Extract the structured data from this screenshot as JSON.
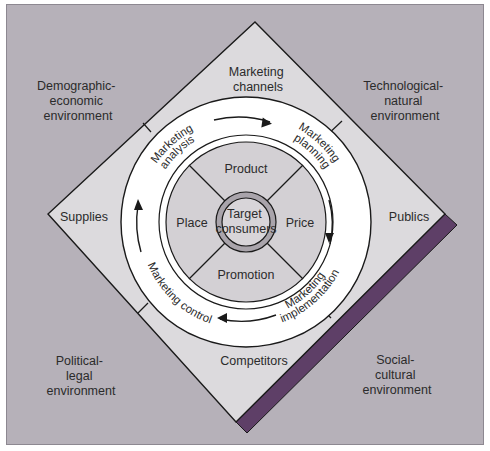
{
  "colors": {
    "background": "#b6b1b9",
    "diamond_fill": "#dcdadd",
    "ring_fill": "#ffffff",
    "mix_fill": "#d3d0d4",
    "target_ring": "#a9a4ab",
    "target_fill": "#d8d5d9",
    "accent_bar": "#5e3f67",
    "line": "#1a1a1a"
  },
  "environment": {
    "top_left": [
      "Demographic-",
      "economic",
      "environment"
    ],
    "top_right": [
      "Technological-",
      "natural",
      "environment"
    ],
    "bottom_left": [
      "Political-",
      "legal",
      "environment"
    ],
    "bottom_right": [
      "Social-",
      "cultural",
      "environment"
    ]
  },
  "actors": {
    "top": [
      "Marketing",
      "channels"
    ],
    "left": "Supplies",
    "right": "Publics",
    "bottom": "Competitors"
  },
  "process": {
    "analysis": [
      "Marketing",
      "analysis"
    ],
    "planning": [
      "Marketing",
      "planning"
    ],
    "implementation": [
      "Marketing",
      "implementation"
    ],
    "control": "Marketing control"
  },
  "mix": {
    "top": "Product",
    "left": "Place",
    "right": "Price",
    "bottom": "Promotion"
  },
  "center": [
    "Target",
    "consumers"
  ]
}
